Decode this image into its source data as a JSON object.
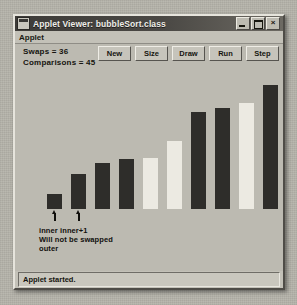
{
  "window": {
    "title": "Applet Viewer: bubbleSort.class",
    "icon": "applet-viewer-icon",
    "controls": {
      "minimize": "_",
      "maximize": "□",
      "close": "×"
    }
  },
  "menubar": {
    "items": [
      {
        "label": "Applet"
      }
    ]
  },
  "stats": {
    "swaps_label": "Swaps = 36",
    "comparisons_label": "Comparisons = 45",
    "swaps": 36,
    "comparisons": 45
  },
  "toolbar": {
    "buttons": [
      {
        "label": "New"
      },
      {
        "label": "Size"
      },
      {
        "label": "Draw"
      },
      {
        "label": "Run"
      },
      {
        "label": "Step"
      }
    ]
  },
  "annotations": {
    "inner_label": "inner",
    "inner_plus_label": "inner+1",
    "line1": "inner inner+1",
    "line2": "Will not be swapped",
    "line3": "outer"
  },
  "statusbar": {
    "text": "Applet started."
  },
  "colors": {
    "bar_dark": "#2e2d2a",
    "bar_light": "#eceae2",
    "applet_bg": "#bcbab1",
    "window_face": "#c3c1b8",
    "titlebar": "#4a4844"
  },
  "chart_data": {
    "type": "bar",
    "xlabel": "",
    "ylabel": "",
    "categories": [
      "0",
      "1",
      "2",
      "3",
      "4",
      "5",
      "6",
      "7",
      "8",
      "9"
    ],
    "values": [
      18,
      42,
      56,
      60,
      62,
      82,
      118,
      122,
      128,
      150
    ],
    "ylim": [
      0,
      160
    ],
    "grid": false,
    "legend": null,
    "bar_colors": [
      "dark",
      "dark",
      "dark",
      "dark",
      "light",
      "light",
      "dark",
      "dark",
      "light",
      "dark"
    ],
    "annotations": [
      {
        "text": "inner",
        "bar_index": 0
      },
      {
        "text": "inner+1",
        "bar_index": 1
      },
      {
        "text": "Will not be swapped",
        "bar_index": 1
      },
      {
        "text": "outer",
        "bar_index": 0
      }
    ]
  }
}
